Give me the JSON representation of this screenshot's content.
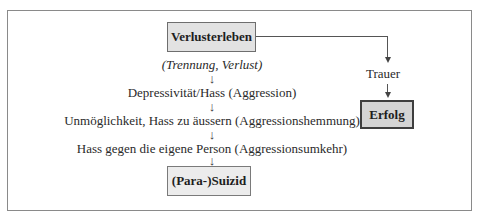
{
  "diagram": {
    "start_node": {
      "label": "Verlusterleben"
    },
    "left_path": {
      "steps": [
        {
          "label": "(Trennung, Verlust)",
          "style": "italic"
        },
        {
          "label": "Depressivität/Hass (Aggression)"
        },
        {
          "label": "Unmöglichkeit, Hass zu äussern (Aggressionshemmung)"
        },
        {
          "label": "Hass gegen die eigene Person (Aggressionsumkehr)"
        }
      ],
      "end_node": {
        "label": "(Para-)Suizid"
      }
    },
    "right_path": {
      "steps": [
        {
          "label": "Trauer"
        }
      ],
      "end_node": {
        "label": "Erfolg"
      }
    },
    "arrow_glyph": "↓",
    "colors": {
      "frame_border": "#8a8a8a",
      "start_box_fill": "#e2e2e2",
      "end_box_fill": "#ececec",
      "success_box_fill": "#d4d4d4",
      "success_box_border": "#3e3e3e"
    }
  }
}
